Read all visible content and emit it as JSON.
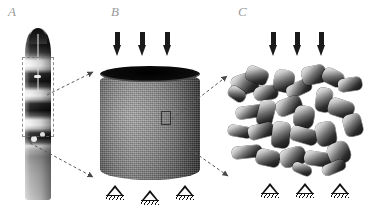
{
  "figure": {
    "background_color": "#ffffff",
    "width": 376,
    "height": 211,
    "caption_visible": false
  },
  "panels": [
    {
      "id": "A",
      "label": "A",
      "name": "whole-spine-specimen",
      "description": "Grayscale photograph of an intact vertebral column segment showing alternating light vertebral bodies and dark intervertebral discs",
      "has_roi_box": true,
      "has_load_arrows": false,
      "has_supports": false
    },
    {
      "id": "B",
      "label": "B",
      "name": "trabecular-bone-core-cylinder",
      "description": "Cylindrical trabecular bone core sample with dark elliptical top face and granular textured side wall",
      "has_roi_box": true,
      "has_load_arrows": true,
      "has_supports": true,
      "load_arrow_count": 3,
      "support_count": 3
    },
    {
      "id": "C",
      "label": "C",
      "name": "trabecular-microstructure",
      "description": "Magnified three-dimensional reconstruction of the trabecular bone network of rods and plates",
      "has_roi_box": false,
      "has_load_arrows": true,
      "has_supports": true,
      "load_arrow_count": 3,
      "support_count": 3
    }
  ],
  "annotations": {
    "load_arrow_symbol": "downward-compressive-load-arrow",
    "support_symbol": "pinned-hatched-support",
    "connector_style": "dashed-arrow",
    "connectors": [
      {
        "from": "A",
        "to": "B",
        "target": "top-left"
      },
      {
        "from": "A",
        "to": "B",
        "target": "bottom-left"
      },
      {
        "from": "B",
        "to": "C",
        "target": "top-left"
      },
      {
        "from": "B",
        "to": "C",
        "target": "bottom-left"
      }
    ]
  },
  "colors": {
    "background": "#ffffff",
    "label_gray": "#9a9a9a",
    "arrow_black": "#1a1a1a",
    "support_black": "#111111",
    "connector_gray": "#5a5a5a"
  }
}
